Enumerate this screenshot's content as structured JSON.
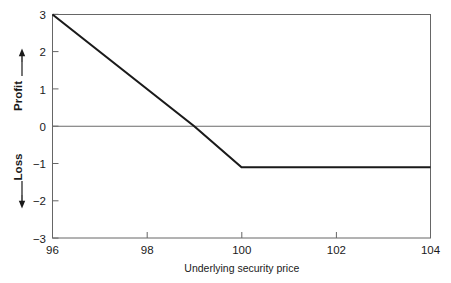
{
  "chart_data": {
    "type": "line",
    "title": "",
    "subtitle": "",
    "xlabel": "Underlying security price",
    "ylabel_profit": "Profit",
    "ylabel_loss": "Loss",
    "ylabel_profit_arrow": "↑",
    "ylabel_loss_arrow": "↓",
    "ylabel_dash": "—",
    "xlim": [
      96,
      104
    ],
    "ylim": [
      -3,
      3
    ],
    "xticks": [
      96,
      98,
      100,
      102,
      104
    ],
    "xtick_labels": [
      "96",
      "98",
      "100",
      "102",
      "104"
    ],
    "yticks": [
      -3,
      -2,
      -1,
      0,
      1,
      2,
      3
    ],
    "ytick_labels": [
      "3",
      "2",
      "1",
      "0",
      "−1",
      "−2",
      "−3"
    ],
    "grid": false,
    "zero_line": true,
    "legend": "none",
    "series": [
      {
        "name": "Profit / loss profile",
        "x": [
          96,
          99,
          100,
          104
        ],
        "values": [
          3,
          0,
          -1.1,
          -1.1
        ],
        "color": "#1a1a1a",
        "linewidth": 2.1
      }
    ],
    "annotations": [],
    "axis_color": "#555555",
    "plot_border": true
  },
  "figure": {
    "background": "#ffffff",
    "frame_color": "#555555"
  }
}
